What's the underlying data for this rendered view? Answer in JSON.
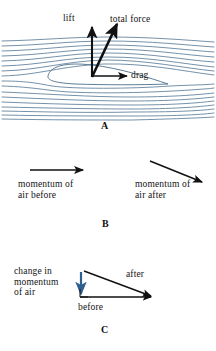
{
  "figure": {
    "colors": {
      "streamline": "#5b7d99",
      "vector": "#111111",
      "airfoil": "#4a6e8a",
      "change_vector": "#2f5f8f",
      "background": "#ffffff"
    }
  },
  "panel_a": {
    "letter": "A",
    "labels": {
      "lift": "lift",
      "total_force": "total force",
      "drag": "drag"
    },
    "vectors": [
      {
        "name": "lift",
        "label": "lift",
        "direction": "up",
        "angle_deg": 90
      },
      {
        "name": "total-force",
        "label": "total force",
        "direction": "up-right",
        "angle_deg": 72
      },
      {
        "name": "drag",
        "label": "drag",
        "direction": "right",
        "angle_deg": 0
      }
    ],
    "streamline_count": 17
  },
  "panel_b": {
    "letter": "B",
    "labels": {
      "before": "momentum of\nair before",
      "after": "momentum of\nair after"
    },
    "vectors": [
      {
        "name": "momentum-before",
        "direction": "right",
        "angle_deg": 0
      },
      {
        "name": "momentum-after",
        "direction": "down-right",
        "angle_deg": -22
      }
    ]
  },
  "panel_c": {
    "letter": "C",
    "labels": {
      "change": "change in\nmomentum\nof air",
      "after": "after",
      "before": "before"
    },
    "vectors": [
      {
        "name": "before-vector",
        "label": "before",
        "direction": "right",
        "angle_deg": 0
      },
      {
        "name": "after-vector",
        "label": "after",
        "direction": "down-right",
        "angle_deg": -26
      },
      {
        "name": "change-vector",
        "label": "change in momentum of air",
        "direction": "down",
        "angle_deg": -90
      }
    ]
  }
}
